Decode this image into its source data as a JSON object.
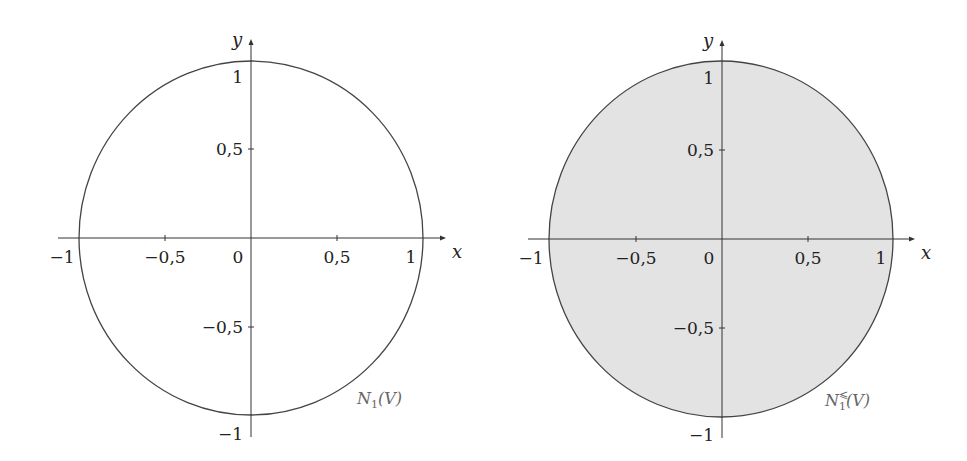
{
  "figure": {
    "panels": [
      {
        "id": "left",
        "x_axis_label": "x",
        "y_axis_label": "y",
        "x_tick_labels": [
          "−1",
          "−0,5",
          "0",
          "0,5",
          "1"
        ],
        "y_tick_labels": [
          "1",
          "0,5",
          "−0,5",
          "−1"
        ],
        "set_label_main": "N",
        "set_label_sub": "1",
        "set_label_sup": "",
        "set_label_arg": "(V)",
        "filled": false,
        "fill_color": "#ffffff"
      },
      {
        "id": "right",
        "x_axis_label": "x",
        "y_axis_label": "y",
        "x_tick_labels": [
          "−1",
          "−0,5",
          "0",
          "0,5",
          "1"
        ],
        "y_tick_labels": [
          "1",
          "0,5",
          "−0,5",
          "−1"
        ],
        "set_label_main": "N",
        "set_label_sub": "1",
        "set_label_sup": "⩽",
        "set_label_arg": "(V)",
        "filled": true,
        "fill_color": "#e3e3e3"
      }
    ],
    "line_color": "#444444"
  }
}
